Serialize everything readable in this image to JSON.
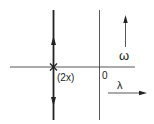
{
  "diagram": {
    "type": "root-locus",
    "pole_label": "(2x)",
    "origin_label": "0",
    "imag_axis_label": "ω",
    "real_axis_label": "λ",
    "colors": {
      "line": "#333333",
      "locus": "#222222",
      "background": "#ffffff"
    }
  }
}
